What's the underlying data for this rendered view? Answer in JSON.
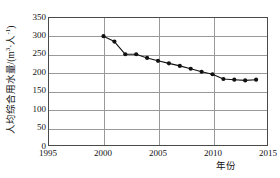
{
  "chart_data": {
    "type": "line",
    "title": "",
    "xlabel": "年份",
    "ylabel": "人均综合用水量/(m³·人⁻¹)",
    "ylabel_parts": {
      "main": "人均综合用水量/(m",
      "sup1": "3",
      "mid": "·人",
      "sup2": "-1",
      "tail": ")"
    },
    "x": [
      2000,
      2001,
      2002,
      2003,
      2004,
      2005,
      2006,
      2007,
      2008,
      2009,
      2010,
      2011,
      2012,
      2013,
      2014
    ],
    "values": [
      300,
      285,
      250,
      250,
      240,
      232,
      225,
      218,
      210,
      202,
      195,
      182,
      180,
      178,
      180
    ],
    "xlim": [
      1995,
      2015
    ],
    "ylim": [
      0,
      350
    ],
    "xticks": [
      1995,
      2000,
      2005,
      2010,
      2015
    ],
    "xtick_labels": [
      "1995",
      "2000",
      "2005",
      "2010",
      "2015"
    ],
    "yticks": [
      0,
      50,
      100,
      150,
      200,
      250,
      300,
      350
    ],
    "ytick_labels": [
      "0",
      "50",
      "100",
      "150",
      "200",
      "250",
      "300",
      "350"
    ],
    "grid": "horizontal-and-vertical",
    "legend": "none",
    "marker": "filled-circle",
    "line_color": "#111111",
    "marker_color": "#111111",
    "grid_color": "#9a9a9a",
    "axis_color": "#4a4a4a",
    "background": "#ffffff"
  }
}
